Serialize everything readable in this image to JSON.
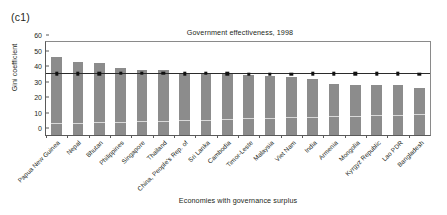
{
  "panel_tag": "(c1)",
  "chart_data": {
    "type": "bar",
    "title": "Government effectiveness, 1998",
    "xlabel": "Economies with governance surplus",
    "ylabel": "Gini coefficient",
    "ylim": [
      0,
      60
    ],
    "yticks": [
      0,
      10,
      20,
      30,
      40,
      50,
      60
    ],
    "grid": false,
    "legend": "none",
    "categories": [
      "Papua New Guinea",
      "Nepal",
      "Bhutan",
      "Philippines",
      "Singapore",
      "Thailand",
      "China, People's Rep. of",
      "Sri Lanka",
      "Cambodia",
      "Timor-Leste",
      "Malaysia",
      "Viet Nam",
      "India",
      "Armenia",
      "Mongolia",
      "Kyrgyz Republic",
      "Lao PDR",
      "Bangladesh"
    ],
    "series": [
      {
        "name": "Gini coefficient",
        "type": "bar",
        "color": "#8c8c8c",
        "values": [
          50.5,
          47.0,
          46.5,
          43.5,
          41.8,
          41.8,
          39.8,
          40.3,
          39.6,
          39.0,
          37.9,
          37.4,
          36.4,
          33.2,
          32.2,
          32.3,
          32.0,
          30.4
        ]
      },
      {
        "name": "Reference marker",
        "type": "line-marker",
        "color": "#111111",
        "marker": "square",
        "values": [
          39.6,
          39.6,
          39.6,
          39.7,
          39.7,
          39.7,
          39.6,
          39.7,
          39.6,
          39.3,
          39.2,
          39.3,
          39.5,
          39.6,
          39.6,
          39.6,
          39.6,
          39.4
        ]
      }
    ]
  }
}
